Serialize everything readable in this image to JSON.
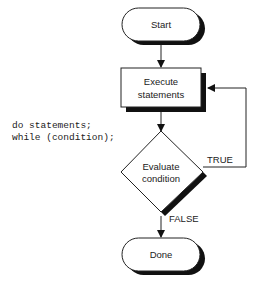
{
  "diagram": {
    "type": "flowchart",
    "code": {
      "line1": "do statements;",
      "line2": "while (condition);"
    },
    "nodes": {
      "start": {
        "shape": "terminal",
        "label": "Start"
      },
      "execute": {
        "shape": "process",
        "line1": "Execute",
        "line2": "statements"
      },
      "evaluate": {
        "shape": "decision",
        "line1": "Evaluate",
        "line2": "condition"
      },
      "done": {
        "shape": "terminal",
        "label": "Done"
      }
    },
    "edges": {
      "true_label": "TRUE",
      "false_label": "FALSE"
    },
    "colors": {
      "stroke": "#222222",
      "shadow": "#111111",
      "fill": "#ffffff"
    }
  }
}
